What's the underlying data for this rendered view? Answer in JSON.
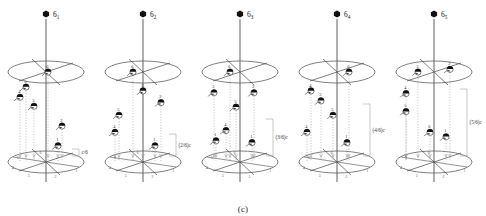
{
  "figure": {
    "caption": "(c)",
    "type": "crystallographic-screw-axis-diagram",
    "colors": {
      "ink": "#1a1a1a",
      "line": "#4a4a4a",
      "ellipse": "#555555",
      "guide": "#9a9a9a",
      "marker_fill": "#111111",
      "background": "#ffffff"
    }
  },
  "panels": [
    {
      "id": "panel-6-1",
      "symbol_base": "6",
      "symbol_sub": "1",
      "translation_label": "c/6",
      "translation_fraction": 0.1667,
      "nodes": [
        {
          "num": "6",
          "x": 48,
          "level": 1.0
        },
        {
          "num": "5",
          "x": 26,
          "level": 0.833
        },
        {
          "num": "4",
          "x": 20,
          "level": 0.72
        },
        {
          "num": "3",
          "x": 34,
          "level": 0.62
        },
        {
          "num": "2",
          "x": 62,
          "level": 0.4
        },
        {
          "num": "1",
          "x": 58,
          "level": 0.18
        }
      ],
      "base_ticks": [
        "1",
        "2",
        "3",
        "4",
        "5",
        "6"
      ]
    },
    {
      "id": "panel-6-2",
      "symbol_base": "6",
      "symbol_sub": "2",
      "translation_label": "(2/6)c",
      "translation_fraction": 0.3333,
      "nodes": [
        {
          "num": "6",
          "x": 36,
          "level": 1.0
        },
        {
          "num": "3",
          "x": 46,
          "level": 0.79
        },
        {
          "num": "2",
          "x": 64,
          "level": 0.66
        },
        {
          "num": "5",
          "x": 22,
          "level": 0.52
        },
        {
          "num": "4",
          "x": 18,
          "level": 0.33
        },
        {
          "num": "1",
          "x": 58,
          "level": 0.18
        }
      ],
      "base_ticks": [
        "1",
        "2",
        "3",
        "4",
        "5",
        "6"
      ]
    },
    {
      "id": "panel-6-3",
      "symbol_base": "6",
      "symbol_sub": "3",
      "translation_label": "(3/6)c",
      "translation_fraction": 0.5,
      "nodes": [
        {
          "num": "6",
          "x": 36,
          "level": 1.0
        },
        {
          "num": "3",
          "x": 20,
          "level": 0.77
        },
        {
          "num": "2",
          "x": 60,
          "level": 0.77
        },
        {
          "num": "5",
          "x": 42,
          "level": 0.61
        },
        {
          "num": "4",
          "x": 32,
          "level": 0.35
        },
        {
          "num": "1",
          "x": 22,
          "level": 0.235
        },
        {
          "num": "1",
          "x": 58,
          "level": 0.215
        }
      ],
      "base_ticks": [
        "1",
        "2",
        "3",
        "4",
        "5",
        "6"
      ]
    },
    {
      "id": "panel-6-4",
      "symbol_base": "6",
      "symbol_sub": "4",
      "translation_label": "(4/6)c",
      "translation_fraction": 0.6667,
      "nodes": [
        {
          "num": "6",
          "x": 58,
          "level": 1.0
        },
        {
          "num": "4",
          "x": 20,
          "level": 0.79
        },
        {
          "num": "3",
          "x": 30,
          "level": 0.68
        },
        {
          "num": "5",
          "x": 42,
          "level": 0.52
        },
        {
          "num": "4",
          "x": 16,
          "level": 0.33
        },
        {
          "num": "1",
          "x": 56,
          "level": 0.215
        }
      ],
      "base_ticks": [
        "1",
        "2",
        "3",
        "4",
        "5",
        "6"
      ]
    },
    {
      "id": "panel-6-5",
      "symbol_base": "6",
      "symbol_sub": "5",
      "translation_label": "(5/6)c",
      "translation_fraction": 0.8333,
      "nodes": [
        {
          "num": "3",
          "x": 30,
          "level": 1.0
        },
        {
          "num": "2",
          "x": 62,
          "level": 1.03
        },
        {
          "num": "4",
          "x": 18,
          "level": 0.76
        },
        {
          "num": "5",
          "x": 18,
          "level": 0.56
        },
        {
          "num": "6",
          "x": 42,
          "level": 0.33
        },
        {
          "num": "1",
          "x": 58,
          "level": 0.28
        }
      ],
      "base_ticks": [
        "1",
        "2",
        "3",
        "4",
        "5",
        "6"
      ]
    }
  ]
}
